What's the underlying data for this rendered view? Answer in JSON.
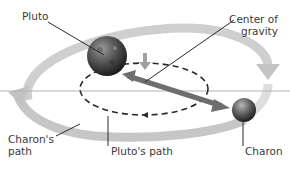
{
  "diagram": {
    "labels": {
      "pluto": "Pluto",
      "center_of_gravity_line1": "Center of",
      "center_of_gravity_line2": "gravity",
      "charons_path_line1": "Charon's",
      "charons_path_line2": "path",
      "plutos_path": "Pluto's path",
      "charon": "Charon"
    },
    "colors": {
      "charon_orbit": "#c8c8c8",
      "pluto_orbit_dashed": "#2a2a2a",
      "separation_arrow": "#6e6e6e",
      "gravity_arrow": "#a0a0a0",
      "plane_line": "#b4b4b4",
      "leader_lines": "#2a2a2a",
      "text": "#3a3a3a"
    },
    "bodies": [
      {
        "name": "Pluto",
        "size": "large"
      },
      {
        "name": "Charon",
        "size": "small"
      }
    ]
  }
}
